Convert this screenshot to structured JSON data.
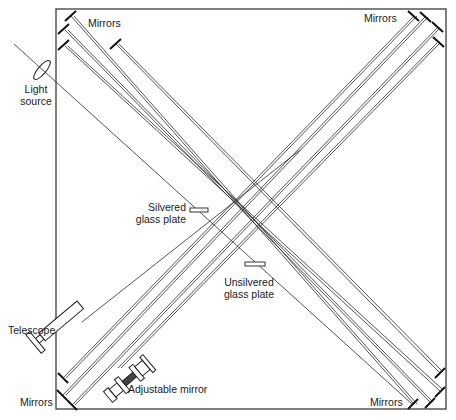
{
  "diagram": {
    "type": "Michelson-Morley interferometer (multi-reflection)",
    "frame": {
      "x": 56,
      "y": 9,
      "width": 390,
      "height": 400,
      "color": "#444444"
    },
    "labels": {
      "mirrors_top_left": "Mirrors",
      "mirrors_top_right": "Mirrors",
      "mirrors_bottom_left": "Mirrors",
      "mirrors_bottom_right": "Mirrors",
      "light_source_line1": "Light",
      "light_source_line2": "source",
      "silvered_line1": "Silvered",
      "silvered_line2": "glass plate",
      "unsilvered_line1": "Unsilvered",
      "unsilvered_line2": "glass plate",
      "telescope": "Telescope",
      "adjustable_mirror": "Adjustable mirror"
    },
    "components": [
      "Light source",
      "Silvered glass plate",
      "Unsilvered glass plate",
      "Telescope",
      "Adjustable mirror",
      "Mirrors (top-left)",
      "Mirrors (top-right)",
      "Mirrors (bottom-left)",
      "Mirrors (bottom-right)"
    ],
    "colors": {
      "line": "#2a2a2a",
      "background": "#ffffff"
    }
  }
}
